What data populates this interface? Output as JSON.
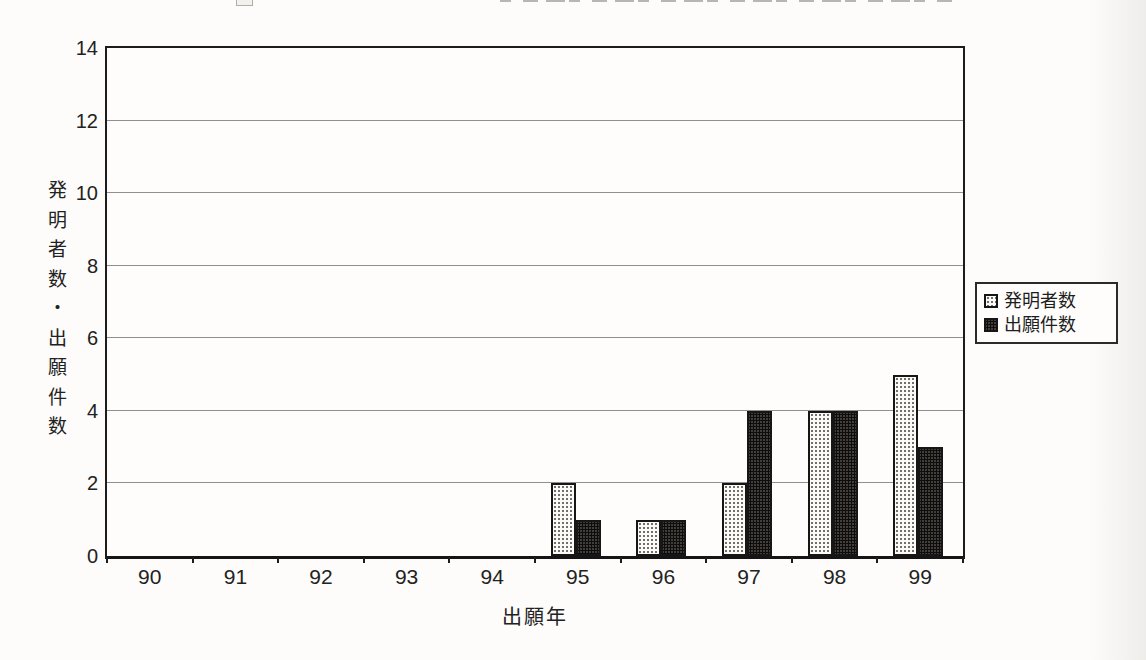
{
  "chart_data": {
    "type": "bar",
    "title": "",
    "categories": [
      "90",
      "91",
      "92",
      "93",
      "94",
      "95",
      "96",
      "97",
      "98",
      "99"
    ],
    "series": [
      {
        "name": "発明者数",
        "style": "light",
        "values": [
          0,
          0,
          0,
          0,
          0,
          2,
          1,
          2,
          4,
          5
        ]
      },
      {
        "name": "出願件数",
        "style": "dark",
        "values": [
          0,
          0,
          0,
          0,
          0,
          1,
          1,
          4,
          4,
          3
        ]
      }
    ],
    "xlabel": "出願年",
    "ylabel": "発明者数・出願件数",
    "ylim": [
      0,
      14
    ],
    "yticks": [
      0,
      2,
      4,
      6,
      8,
      10,
      12,
      14
    ],
    "grid": true,
    "legend_position": "right-outside",
    "legend": [
      "発明者数",
      "出願件数"
    ]
  },
  "colors": {
    "frame": "#1c1c1c",
    "gridline": "#909090",
    "bar_light_bg": "#fbfaf5",
    "bar_light_dot": "#6f6f6f",
    "bar_dark_bg": "#433e3a",
    "bar_dark_dot": "#0d0d0d",
    "text": "#222222",
    "paper": "#fdfcfa"
  }
}
